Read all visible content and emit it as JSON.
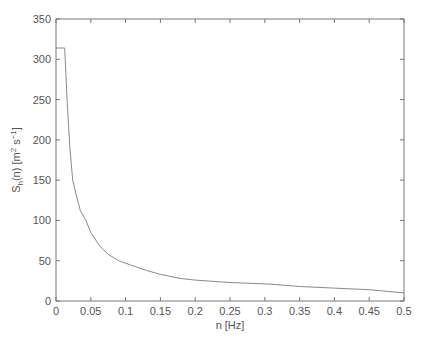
{
  "chart_data": {
    "type": "line",
    "title": "",
    "xlabel": "n [Hz]",
    "ylabel_parts": {
      "main": "S",
      "sub": "h",
      "rest1": "(n) [m",
      "sup1": "2",
      "rest2": " s",
      "sup2": "−1",
      "rest3": "]"
    },
    "ylabel": "S_h(n) [m^2 s^-1]",
    "xlim": [
      0,
      0.5
    ],
    "ylim": [
      0,
      350
    ],
    "xticks": [
      0,
      0.05,
      0.1,
      0.15,
      0.2,
      0.25,
      0.3,
      0.35,
      0.4,
      0.45,
      0.5
    ],
    "xtick_labels": [
      "0",
      "0.05",
      "0.1",
      "0.15",
      "0.2",
      "0.25",
      "0.3",
      "0.35",
      "0.4",
      "0.45",
      "0.5"
    ],
    "yticks": [
      0,
      50,
      100,
      150,
      200,
      250,
      300,
      350
    ],
    "ytick_labels": [
      "0",
      "50",
      "100",
      "150",
      "200",
      "250",
      "300",
      "350"
    ],
    "grid": false,
    "legend": null,
    "line_color": "#8a8a8a",
    "series": [
      {
        "name": "S_h(n)",
        "x": [
          0,
          0.0125,
          0.016,
          0.02,
          0.024,
          0.03,
          0.035,
          0.043,
          0.05,
          0.063,
          0.075,
          0.09,
          0.106,
          0.13,
          0.15,
          0.178,
          0.2,
          0.25,
          0.307,
          0.35,
          0.4,
          0.45,
          0.5
        ],
        "values": [
          314,
          314,
          249,
          190,
          150,
          128,
          112,
          100,
          85,
          68,
          58,
          50,
          45,
          38,
          33,
          28,
          26,
          23,
          21,
          18,
          16,
          14,
          10
        ]
      }
    ]
  }
}
